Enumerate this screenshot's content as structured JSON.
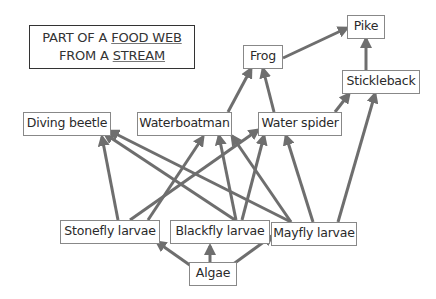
{
  "title": {
    "line1_prefix": "PART OF A ",
    "line1_underlined": "FOOD WEB",
    "line2_prefix": "FROM A ",
    "line2_underlined": "STREAM"
  },
  "colors": {
    "arrow": "#6e6e6e",
    "node_border": "#888888",
    "text": "#2a2a2a"
  },
  "nodes": [
    {
      "id": "pike",
      "label": "Pike"
    },
    {
      "id": "frog",
      "label": "Frog"
    },
    {
      "id": "stickleback",
      "label": "Stickleback"
    },
    {
      "id": "diving_beetle",
      "label": "Diving beetle"
    },
    {
      "id": "waterboatman",
      "label": "Waterboatman"
    },
    {
      "id": "water_spider",
      "label": "Water spider"
    },
    {
      "id": "stonefly_larvae",
      "label": "Stonefly larvae"
    },
    {
      "id": "blackfly_larvae",
      "label": "Blackfly larvae"
    },
    {
      "id": "mayfly_larvae",
      "label": "Mayfly larvae"
    },
    {
      "id": "algae",
      "label": "Algae"
    }
  ],
  "edges": [
    {
      "from": "algae",
      "to": "stonefly_larvae"
    },
    {
      "from": "algae",
      "to": "blackfly_larvae"
    },
    {
      "from": "algae",
      "to": "mayfly_larvae"
    },
    {
      "from": "stonefly_larvae",
      "to": "diving_beetle"
    },
    {
      "from": "stonefly_larvae",
      "to": "waterboatman"
    },
    {
      "from": "stonefly_larvae",
      "to": "water_spider"
    },
    {
      "from": "blackfly_larvae",
      "to": "diving_beetle"
    },
    {
      "from": "blackfly_larvae",
      "to": "waterboatman"
    },
    {
      "from": "blackfly_larvae",
      "to": "water_spider"
    },
    {
      "from": "mayfly_larvae",
      "to": "diving_beetle"
    },
    {
      "from": "mayfly_larvae",
      "to": "waterboatman"
    },
    {
      "from": "mayfly_larvae",
      "to": "water_spider"
    },
    {
      "from": "mayfly_larvae",
      "to": "stickleback"
    },
    {
      "from": "waterboatman",
      "to": "frog"
    },
    {
      "from": "water_spider",
      "to": "frog"
    },
    {
      "from": "water_spider",
      "to": "stickleback"
    },
    {
      "from": "frog",
      "to": "pike"
    },
    {
      "from": "stickleback",
      "to": "pike"
    }
  ]
}
